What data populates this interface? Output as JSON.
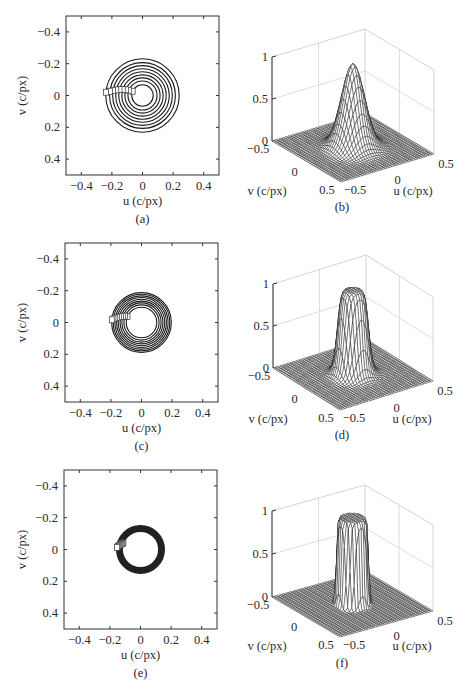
{
  "figure": {
    "panels": [
      {
        "id": "a",
        "caption": "(a)",
        "kind": "contour"
      },
      {
        "id": "b",
        "caption": "(b)",
        "kind": "surface"
      },
      {
        "id": "c",
        "caption": "(c)",
        "kind": "contour"
      },
      {
        "id": "d",
        "caption": "(d)",
        "kind": "surface"
      },
      {
        "id": "e",
        "caption": "(e)",
        "kind": "contour"
      },
      {
        "id": "f",
        "caption": "(f)",
        "kind": "surface"
      }
    ],
    "contour_axes": {
      "xlabel": "u (c/px)",
      "ylabel": "v (c/px)",
      "xticks": [
        "−0.4",
        "−0.2",
        "0",
        "0.2",
        "0.4"
      ],
      "yticks": [
        "−0.4",
        "−0.2",
        "0",
        "0.2",
        "0.4"
      ]
    },
    "surface_axes": {
      "xlabel": "u (c/px)",
      "ylabel": "v (c/px)",
      "zticks": [
        "0",
        "0.5",
        "1"
      ],
      "uticks": [
        "−0.5",
        "0",
        "0.5"
      ],
      "vticks": [
        "−0.5",
        "0",
        "0.5"
      ]
    }
  },
  "chart_data": [
    {
      "panel": "a",
      "type": "contour",
      "title": "",
      "xlabel": "u (c/px)",
      "ylabel": "v (c/px)",
      "xlim": [
        -0.5,
        0.5
      ],
      "ylim": [
        -0.5,
        0.5
      ],
      "y_reversed": true,
      "center": [
        0,
        0
      ],
      "contour_radii": [
        0.07,
        0.095,
        0.115,
        0.135,
        0.155,
        0.175,
        0.195,
        0.215,
        0.24
      ],
      "contour_levels": [
        0.1,
        0.2,
        0.3,
        0.4,
        0.5,
        0.6,
        0.7,
        0.8,
        0.9
      ]
    },
    {
      "panel": "b",
      "type": "surface",
      "xlabel": "u (c/px)",
      "ylabel": "v (c/px)",
      "zlabel": "",
      "xlim": [
        -0.5,
        0.5
      ],
      "ylim": [
        -0.5,
        0.5
      ],
      "zlim": [
        0,
        1
      ],
      "profile": "gaussian",
      "peak": 1.0,
      "sigma": 0.1
    },
    {
      "panel": "c",
      "type": "contour",
      "title": "",
      "xlabel": "u (c/px)",
      "ylabel": "v (c/px)",
      "xlim": [
        -0.5,
        0.5
      ],
      "ylim": [
        -0.5,
        0.5
      ],
      "y_reversed": true,
      "center": [
        0,
        0
      ],
      "contour_radii": [
        0.1,
        0.115,
        0.128,
        0.14,
        0.152,
        0.163,
        0.174,
        0.185,
        0.195
      ],
      "contour_levels": [
        0.1,
        0.2,
        0.3,
        0.4,
        0.5,
        0.6,
        0.7,
        0.8,
        0.9
      ]
    },
    {
      "panel": "d",
      "type": "surface",
      "xlabel": "u (c/px)",
      "ylabel": "v (c/px)",
      "zlabel": "",
      "xlim": [
        -0.5,
        0.5
      ],
      "ylim": [
        -0.5,
        0.5
      ],
      "zlim": [
        0,
        1
      ],
      "profile": "butterworth",
      "peak": 1.0,
      "cutoff": 0.14,
      "order": 4
    },
    {
      "panel": "e",
      "type": "contour",
      "title": "",
      "xlabel": "u (c/px)",
      "ylabel": "v (c/px)",
      "xlim": [
        -0.5,
        0.5
      ],
      "ylim": [
        -0.5,
        0.5
      ],
      "y_reversed": true,
      "center": [
        0,
        0
      ],
      "contour_radii": [
        0.12,
        0.125,
        0.13,
        0.135,
        0.14,
        0.145,
        0.15,
        0.155
      ],
      "contour_levels": [
        0.1,
        0.2,
        0.3,
        0.4,
        0.5,
        0.6,
        0.7,
        0.8,
        0.9
      ]
    },
    {
      "panel": "f",
      "type": "surface",
      "xlabel": "u (c/px)",
      "ylabel": "v (c/px)",
      "zlabel": "",
      "xlim": [
        -0.5,
        0.5
      ],
      "ylim": [
        -0.5,
        0.5
      ],
      "zlim": [
        0,
        1
      ],
      "profile": "butterworth",
      "peak": 1.0,
      "cutoff": 0.14,
      "order": 12
    }
  ]
}
